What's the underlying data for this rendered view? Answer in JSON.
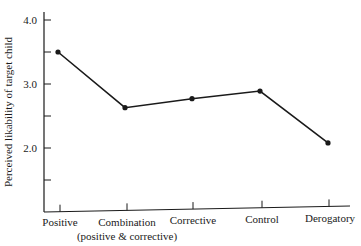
{
  "chart_data": {
    "type": "line",
    "title": "",
    "xlabel": "",
    "ylabel": "Perceived likability of target child",
    "categories": [
      "Positive",
      "Combination (positive & corrective)",
      "Corrective",
      "Control",
      "Derogatory"
    ],
    "category_labels": [
      {
        "line1": "Positive",
        "line2": ""
      },
      {
        "line1": "Combination",
        "line2": "(positive & corrective)"
      },
      {
        "line1": "Corrective",
        "line2": ""
      },
      {
        "line1": "Control",
        "line2": ""
      },
      {
        "line1": "Derogatory",
        "line2": ""
      }
    ],
    "values": [
      3.5,
      2.63,
      2.77,
      2.89,
      2.08
    ],
    "ylim": [
      1.0,
      4.0
    ],
    "yticks": [
      4.0,
      3.5,
      3.0,
      2.5,
      2.0,
      1.5
    ],
    "ytick_labels": [
      "4.0",
      "3.0",
      "2.0"
    ],
    "grid": false,
    "legend": null,
    "line_color": "#1a1a1a"
  }
}
